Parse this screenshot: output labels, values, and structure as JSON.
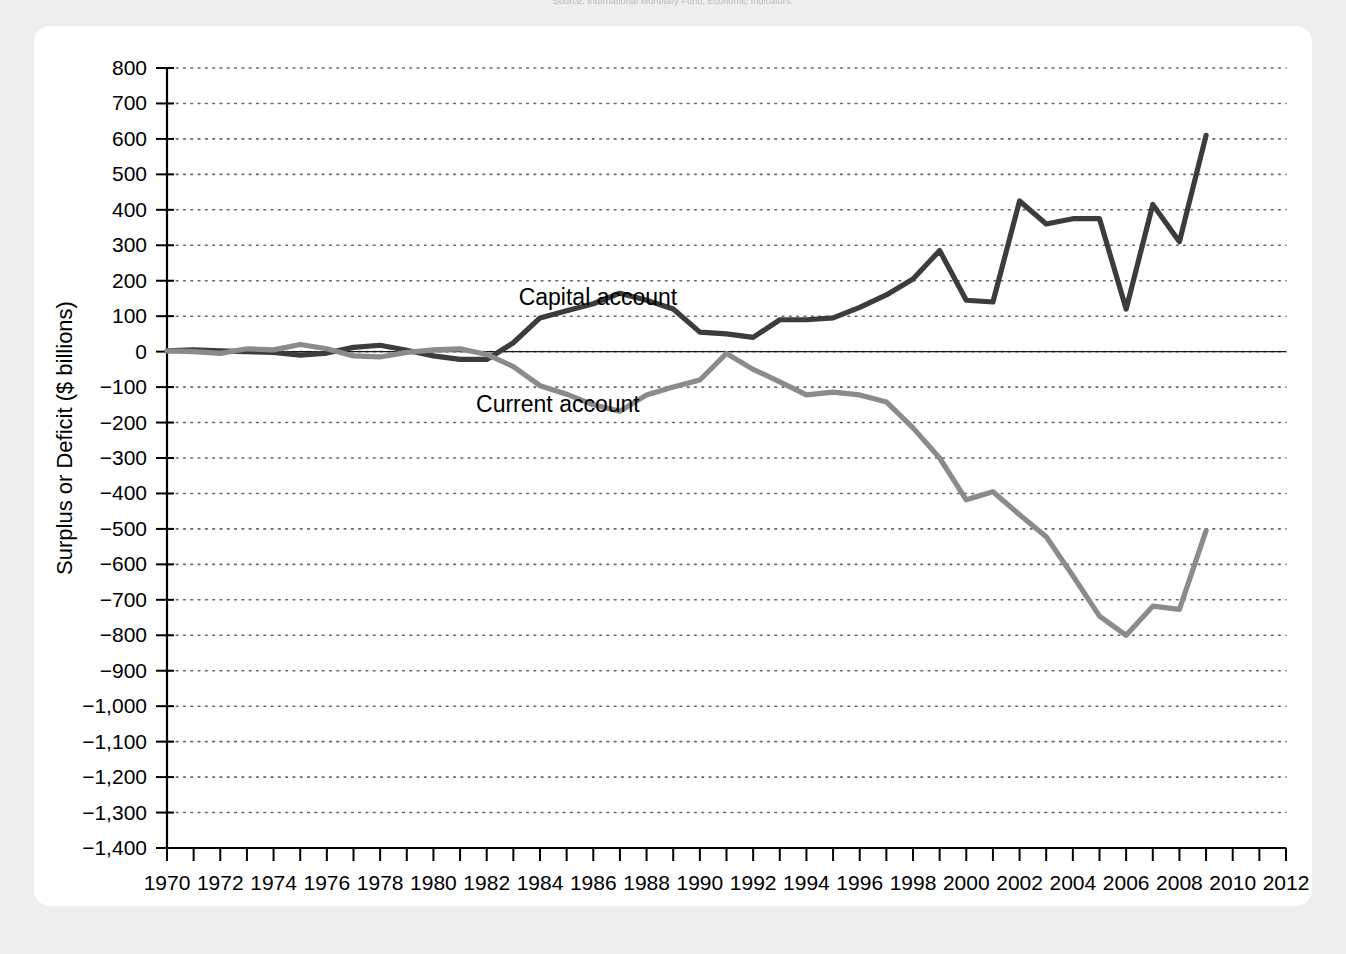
{
  "source_note": "Source: International Monetary Fund, Economic Indicators.",
  "chart_data": {
    "type": "line",
    "title": "",
    "xlabel": "Year",
    "ylabel": "Surplus or Deficit ($ billions)",
    "xlim": [
      1970,
      2012
    ],
    "ylim": [
      -1400,
      800
    ],
    "grid": true,
    "legend_position": "inline-annotation",
    "ytick_labels": [
      "800",
      "700",
      "600",
      "500",
      "400",
      "300",
      "200",
      "100",
      "0",
      "−100",
      "−200",
      "−300",
      "−400",
      "−500",
      "−600",
      "−700",
      "−800",
      "−900",
      "−1,000",
      "−1,100",
      "−1,200",
      "−1,300",
      "−1,400"
    ],
    "yticks": [
      800,
      700,
      600,
      500,
      400,
      300,
      200,
      100,
      0,
      -100,
      -200,
      -300,
      -400,
      -500,
      -600,
      -700,
      -800,
      -900,
      -1000,
      -1100,
      -1200,
      -1300,
      -1400
    ],
    "xtick_labels": [
      "1970",
      "1972",
      "1974",
      "1976",
      "1978",
      "1980",
      "1982",
      "1984",
      "1986",
      "1988",
      "1990",
      "1992",
      "1994",
      "1996",
      "1998",
      "2000",
      "2002",
      "2004",
      "2006",
      "2008",
      "2010",
      "2012"
    ],
    "xticks_major": [
      1970,
      1972,
      1974,
      1976,
      1978,
      1980,
      1982,
      1984,
      1986,
      1988,
      1990,
      1992,
      1994,
      1996,
      1998,
      2000,
      2002,
      2004,
      2006,
      2008,
      2010,
      2012
    ],
    "x": [
      1970,
      1971,
      1972,
      1973,
      1974,
      1975,
      1976,
      1977,
      1978,
      1979,
      1980,
      1981,
      1982,
      1983,
      1984,
      1985,
      1986,
      1987,
      1988,
      1989,
      1990,
      1991,
      1992,
      1993,
      1994,
      1995,
      1996,
      1997,
      1998,
      1999,
      2000,
      2001,
      2002,
      2003,
      2004,
      2005,
      2006,
      2007,
      2008,
      2009
    ],
    "series": [
      {
        "name": "Capital account",
        "color": "#3c3c3c",
        "label_x": 1983.2,
        "label_y": 155,
        "values": [
          2,
          5,
          2,
          0,
          -2,
          -10,
          -4,
          12,
          18,
          4,
          -12,
          -22,
          -22,
          25,
          95,
          115,
          135,
          165,
          145,
          120,
          55,
          50,
          40,
          90,
          90,
          95,
          125,
          160,
          205,
          285,
          145,
          140,
          425,
          360,
          375,
          375,
          120,
          415,
          310,
          610
        ],
        "endpoint_value": 610
      },
      {
        "name": "Current account",
        "color": "#8b8b8b",
        "label_x": 1981.6,
        "label_y": -148,
        "values": [
          2,
          0,
          -5,
          8,
          5,
          20,
          8,
          -12,
          -15,
          -2,
          5,
          8,
          -8,
          -42,
          -96,
          -120,
          -150,
          -168,
          -122,
          -100,
          -80,
          -5,
          -50,
          -85,
          -122,
          -114,
          -122,
          -142,
          -215,
          -300,
          -418,
          -395,
          -460,
          -522,
          -632,
          -746,
          -800,
          -718,
          -727,
          -505
        ],
        "endpoint_value": -505
      }
    ]
  }
}
